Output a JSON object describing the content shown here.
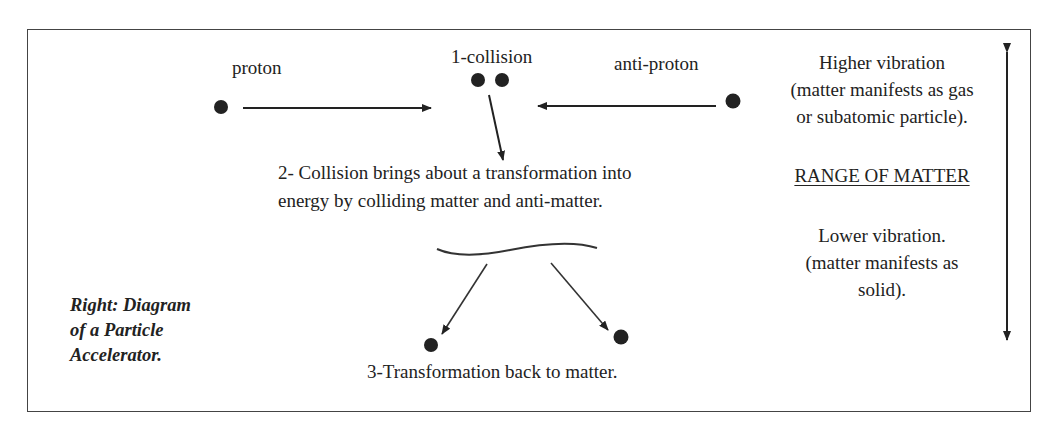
{
  "diagram": {
    "labels": {
      "proton": "proton",
      "collision": "1-collision",
      "anti_proton": "anti-proton",
      "step2_line1": "2- Collision brings about a transformation into",
      "step2_line2": "energy by colliding matter and anti-matter.",
      "step3": "3-Transformation back to matter."
    },
    "caption": {
      "line1": "Right: Diagram",
      "line2": "of a Particle",
      "line3": "Accelerator."
    },
    "range": {
      "higher_line1": "Higher vibration",
      "higher_line2": "(matter manifests as gas",
      "higher_line3": "or subatomic particle).",
      "heading": "RANGE OF MATTER",
      "lower_line1": "Lower vibration.",
      "lower_line2": "(matter manifests as",
      "lower_line3": "solid)."
    },
    "nodes": [
      {
        "id": "proton-particle",
        "x": 221,
        "y": 107
      },
      {
        "id": "collision-particle-1",
        "x": 478,
        "y": 80
      },
      {
        "id": "collision-particle-2",
        "x": 502,
        "y": 80
      },
      {
        "id": "anti-proton-particle",
        "x": 733,
        "y": 101
      },
      {
        "id": "result-particle-left",
        "x": 431,
        "y": 345
      },
      {
        "id": "result-particle-right",
        "x": 621,
        "y": 337
      }
    ],
    "edges": [
      {
        "from": "proton-particle",
        "to": "collision",
        "type": "arrow"
      },
      {
        "from": "anti-proton-particle",
        "to": "collision",
        "type": "arrow"
      },
      {
        "from": "collision",
        "to": "energy",
        "type": "arrow"
      },
      {
        "from": "energy",
        "to": "result-particle-left",
        "type": "arrow"
      },
      {
        "from": "energy",
        "to": "result-particle-right",
        "type": "arrow"
      },
      {
        "from": "lower-vibration",
        "to": "higher-vibration",
        "type": "double-arrow"
      }
    ],
    "colors": {
      "ink": "#222222",
      "border": "#444444",
      "background": "#ffffff"
    }
  }
}
